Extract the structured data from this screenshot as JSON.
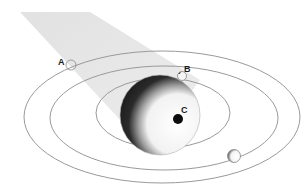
{
  "diagram": {
    "title": "",
    "labels": {
      "a": "A",
      "b": "B",
      "c": "C"
    },
    "colors": {
      "background": "#ffffff",
      "beam": "#e4e4e4",
      "orbit_stroke": "#9a9a9a",
      "sphere_light": "#f2f2f2",
      "sphere_dark": "#1e1e1e",
      "spot": "#0d0d0d",
      "label": "#1a1a1a"
    },
    "elements": [
      {
        "id": "light-beam",
        "type": "band",
        "description": "light gray beam from upper-left toward the sphere"
      },
      {
        "id": "outer-orbit",
        "type": "ellipse"
      },
      {
        "id": "middle-orbit",
        "type": "ellipse"
      },
      {
        "id": "inner-orbit",
        "type": "ellipse"
      },
      {
        "id": "central-sphere",
        "type": "sphere",
        "description": "half-shaded sphere, dark on the beam side"
      },
      {
        "id": "moon-a",
        "type": "small-circle",
        "label": "A"
      },
      {
        "id": "moon-b",
        "type": "small-circle",
        "label": "B"
      },
      {
        "id": "spot-c",
        "type": "dark-dot",
        "label": "C"
      },
      {
        "id": "moon-bottom",
        "type": "small-circle",
        "description": "unlabeled moon with shaded left crescent on middle orbit"
      }
    ]
  }
}
